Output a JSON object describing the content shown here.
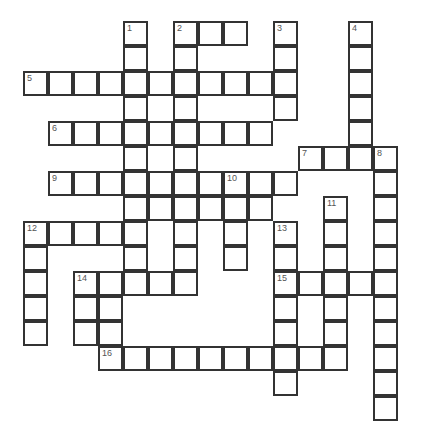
{
  "puzzle": {
    "type": "crossword-grid",
    "title": "",
    "canvas": {
      "width": 427,
      "height": 437
    },
    "background_color": "#ffffff",
    "cell": {
      "size": 25,
      "fill_color": "#ffffff",
      "border_color": "#333333",
      "border_width": 2
    },
    "origin": {
      "x": 23,
      "y": 21
    },
    "grid_dimensions": {
      "columns": 16,
      "rows": 16
    },
    "number_color": "#555555",
    "clue_numbers": [
      {
        "label": "1",
        "col": 4,
        "row": 0
      },
      {
        "label": "2",
        "col": 6,
        "row": 0
      },
      {
        "label": "3",
        "col": 10,
        "row": 0
      },
      {
        "label": "4",
        "col": 13,
        "row": 0
      },
      {
        "label": "5",
        "col": 0,
        "row": 2
      },
      {
        "label": "6",
        "col": 1,
        "row": 4
      },
      {
        "label": "7",
        "col": 11,
        "row": 5
      },
      {
        "label": "8",
        "col": 14,
        "row": 5
      },
      {
        "label": "9",
        "col": 1,
        "row": 6
      },
      {
        "label": "10",
        "col": 8,
        "row": 6
      },
      {
        "label": "11",
        "col": 12,
        "row": 7
      },
      {
        "label": "12",
        "col": 0,
        "row": 8
      },
      {
        "label": "13",
        "col": 10,
        "row": 8
      },
      {
        "label": "14",
        "col": 2,
        "row": 10
      },
      {
        "label": "15",
        "col": 10,
        "row": 10
      },
      {
        "label": "16",
        "col": 3,
        "row": 13
      }
    ],
    "cells": [
      {
        "col": 4,
        "row": 0
      },
      {
        "col": 6,
        "row": 0
      },
      {
        "col": 7,
        "row": 0
      },
      {
        "col": 8,
        "row": 0
      },
      {
        "col": 10,
        "row": 0
      },
      {
        "col": 13,
        "row": 0
      },
      {
        "col": 4,
        "row": 1
      },
      {
        "col": 6,
        "row": 1
      },
      {
        "col": 10,
        "row": 1
      },
      {
        "col": 13,
        "row": 1
      },
      {
        "col": 0,
        "row": 2
      },
      {
        "col": 1,
        "row": 2
      },
      {
        "col": 2,
        "row": 2
      },
      {
        "col": 3,
        "row": 2
      },
      {
        "col": 4,
        "row": 2
      },
      {
        "col": 5,
        "row": 2
      },
      {
        "col": 6,
        "row": 2
      },
      {
        "col": 7,
        "row": 2
      },
      {
        "col": 8,
        "row": 2
      },
      {
        "col": 9,
        "row": 2
      },
      {
        "col": 10,
        "row": 2
      },
      {
        "col": 13,
        "row": 2
      },
      {
        "col": 4,
        "row": 3
      },
      {
        "col": 6,
        "row": 3
      },
      {
        "col": 10,
        "row": 3
      },
      {
        "col": 13,
        "row": 3
      },
      {
        "col": 1,
        "row": 4
      },
      {
        "col": 2,
        "row": 4
      },
      {
        "col": 3,
        "row": 4
      },
      {
        "col": 4,
        "row": 4
      },
      {
        "col": 5,
        "row": 4
      },
      {
        "col": 6,
        "row": 4
      },
      {
        "col": 7,
        "row": 4
      },
      {
        "col": 8,
        "row": 4
      },
      {
        "col": 9,
        "row": 4
      },
      {
        "col": 13,
        "row": 4
      },
      {
        "col": 4,
        "row": 5
      },
      {
        "col": 6,
        "row": 5
      },
      {
        "col": 11,
        "row": 5
      },
      {
        "col": 12,
        "row": 5
      },
      {
        "col": 13,
        "row": 5
      },
      {
        "col": 14,
        "row": 5
      },
      {
        "col": 1,
        "row": 6
      },
      {
        "col": 2,
        "row": 6
      },
      {
        "col": 3,
        "row": 6
      },
      {
        "col": 4,
        "row": 6
      },
      {
        "col": 5,
        "row": 6
      },
      {
        "col": 6,
        "row": 6
      },
      {
        "col": 7,
        "row": 6
      },
      {
        "col": 8,
        "row": 6
      },
      {
        "col": 9,
        "row": 6
      },
      {
        "col": 10,
        "row": 6
      },
      {
        "col": 14,
        "row": 6
      },
      {
        "col": 4,
        "row": 7
      },
      {
        "col": 5,
        "row": 7
      },
      {
        "col": 6,
        "row": 7
      },
      {
        "col": 7,
        "row": 7
      },
      {
        "col": 8,
        "row": 7
      },
      {
        "col": 9,
        "row": 7
      },
      {
        "col": 12,
        "row": 7
      },
      {
        "col": 14,
        "row": 7
      },
      {
        "col": 0,
        "row": 8
      },
      {
        "col": 1,
        "row": 8
      },
      {
        "col": 2,
        "row": 8
      },
      {
        "col": 3,
        "row": 8
      },
      {
        "col": 4,
        "row": 8
      },
      {
        "col": 6,
        "row": 8
      },
      {
        "col": 8,
        "row": 8
      },
      {
        "col": 10,
        "row": 8
      },
      {
        "col": 12,
        "row": 8
      },
      {
        "col": 14,
        "row": 8
      },
      {
        "col": 0,
        "row": 9
      },
      {
        "col": 4,
        "row": 9
      },
      {
        "col": 6,
        "row": 9
      },
      {
        "col": 8,
        "row": 9
      },
      {
        "col": 10,
        "row": 9
      },
      {
        "col": 12,
        "row": 9
      },
      {
        "col": 14,
        "row": 9
      },
      {
        "col": 0,
        "row": 10
      },
      {
        "col": 2,
        "row": 10
      },
      {
        "col": 3,
        "row": 10
      },
      {
        "col": 4,
        "row": 10
      },
      {
        "col": 5,
        "row": 10
      },
      {
        "col": 6,
        "row": 10
      },
      {
        "col": 10,
        "row": 10
      },
      {
        "col": 11,
        "row": 10
      },
      {
        "col": 12,
        "row": 10
      },
      {
        "col": 13,
        "row": 10
      },
      {
        "col": 14,
        "row": 10
      },
      {
        "col": 0,
        "row": 11
      },
      {
        "col": 2,
        "row": 11
      },
      {
        "col": 3,
        "row": 11
      },
      {
        "col": 10,
        "row": 11
      },
      {
        "col": 12,
        "row": 11
      },
      {
        "col": 14,
        "row": 11
      },
      {
        "col": 0,
        "row": 12
      },
      {
        "col": 2,
        "row": 12
      },
      {
        "col": 3,
        "row": 12
      },
      {
        "col": 10,
        "row": 12
      },
      {
        "col": 12,
        "row": 12
      },
      {
        "col": 14,
        "row": 12
      },
      {
        "col": 3,
        "row": 13
      },
      {
        "col": 4,
        "row": 13
      },
      {
        "col": 5,
        "row": 13
      },
      {
        "col": 6,
        "row": 13
      },
      {
        "col": 7,
        "row": 13
      },
      {
        "col": 8,
        "row": 13
      },
      {
        "col": 9,
        "row": 13
      },
      {
        "col": 10,
        "row": 13
      },
      {
        "col": 11,
        "row": 13
      },
      {
        "col": 12,
        "row": 13
      },
      {
        "col": 14,
        "row": 13
      },
      {
        "col": 10,
        "row": 14
      },
      {
        "col": 14,
        "row": 14
      },
      {
        "col": 14,
        "row": 15
      }
    ]
  }
}
